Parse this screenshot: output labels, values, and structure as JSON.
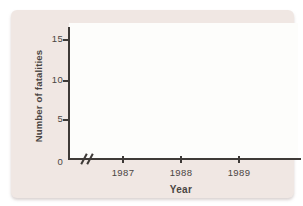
{
  "figure": {
    "colors": {
      "card_bg": "#f0e7e3",
      "plot_bg": "#fdfdfb",
      "axis": "#3e3a37",
      "text": "#4a4542"
    }
  },
  "chart_data": {
    "type": "line",
    "title": "",
    "xlabel": "Year",
    "ylabel": "Number of fatalities",
    "x_tick_labels": [
      "1987",
      "1988",
      "1989"
    ],
    "y_tick_labels": [
      "0",
      "5",
      "10",
      "15"
    ],
    "ylim": [
      0,
      15
    ],
    "y_tick_values": [
      0,
      5,
      10,
      15
    ],
    "series": [],
    "grid": false,
    "legend": "none",
    "x_axis_break": true
  }
}
